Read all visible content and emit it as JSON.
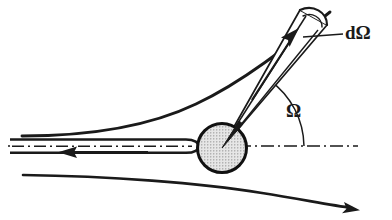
{
  "figure": {
    "type": "physics-diagram",
    "width": 392,
    "height": 220,
    "background_color": "#ffffff",
    "ink_color": "#1a1a1a"
  },
  "labels": {
    "solid_angle_element": "dΩ",
    "scattering_angle": "Ω"
  },
  "elements": {
    "scattering_center": {
      "name": "scattering-center-circle",
      "cx": 222,
      "cy": 148,
      "r": 25,
      "fill_pattern": "stipple",
      "fill_color": "#d8d8d8",
      "stroke_color": "#111111",
      "stroke_width": 3
    },
    "incident_beam": {
      "name": "incident-beam-tube",
      "description": "narrow horizontal tube with leftward arrow",
      "x_start": 10,
      "x_end": 196,
      "y": 146,
      "arrow_direction": "left",
      "arrow_tip_x": 62,
      "arrow_tip_y": 152
    },
    "axis_line": {
      "name": "reference-axis",
      "style": "dash-dot",
      "x_start": 8,
      "x_end": 358,
      "y": 146
    },
    "upper_trajectory": {
      "name": "upper-deflected-trajectory",
      "x_start": 22,
      "y_start": 136,
      "x_end": 330,
      "y_end": 12
    },
    "lower_trajectory": {
      "name": "lower-deflected-trajectory",
      "x_start": 23,
      "y_start": 175,
      "x_end": 358,
      "y_end": 209,
      "arrow_direction": "right-down"
    },
    "solid_angle_cone": {
      "name": "solid-angle-cone",
      "apex_x": 222,
      "apex_y": 148,
      "end_center_x": 312,
      "end_center_y": 24,
      "cap": "spherical-cap-arc",
      "inner_arrow_direction": "up-right"
    },
    "angle_arc": {
      "name": "scattering-angle-arc",
      "center_x": 222,
      "center_y": 148,
      "radius": 82,
      "from_deg": 0,
      "to_deg": 54
    },
    "leader_line": {
      "name": "d-omega-leader-line",
      "x_start": 305,
      "y_start": 37,
      "x_end": 342,
      "y_end": 35
    }
  },
  "label_positions": {
    "d_omega": {
      "x": 345,
      "y": 35
    },
    "omega": {
      "x": 286,
      "y": 113
    }
  }
}
